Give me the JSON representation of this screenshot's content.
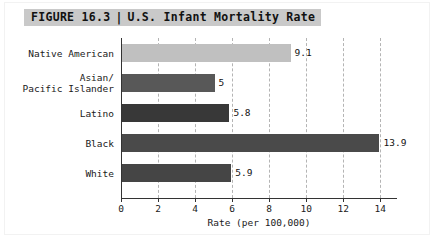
{
  "figure": {
    "label": "FIGURE 16.3",
    "separator": "|",
    "title": "U.S. Infant Mortality Rate"
  },
  "chart_data": {
    "type": "bar",
    "orientation": "horizontal",
    "title": "U.S. Infant Mortality Rate",
    "xlabel": "Rate (per 100,000)",
    "ylabel": "",
    "xlim": [
      0,
      14.9
    ],
    "xticks": [
      0,
      2,
      4,
      6,
      8,
      10,
      12,
      14
    ],
    "xtick_labels": [
      "0",
      "2",
      "4",
      "6",
      "8",
      "10",
      "12",
      "14"
    ],
    "grid": "vertical-dashed",
    "legend": "none",
    "categories": [
      "Native American",
      "Asian/\nPacific Islander",
      "Latino",
      "Black",
      "White"
    ],
    "values": [
      9.1,
      5,
      5.8,
      13.9,
      5.9
    ],
    "value_labels": [
      "9.1",
      "5",
      "5.8",
      "13.9",
      "5.9"
    ],
    "bar_colors": [
      "#c0c0c0",
      "#585858",
      "#383838",
      "#4a4a4a",
      "#454545"
    ]
  }
}
